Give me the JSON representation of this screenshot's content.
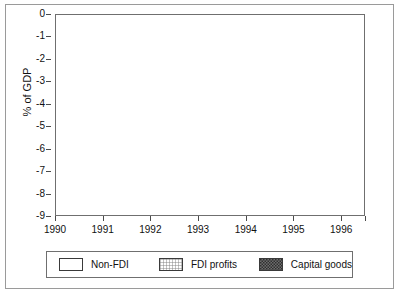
{
  "chart_data": {
    "type": "area",
    "title": "",
    "subtitle": "",
    "xlabel": "",
    "ylabel": "% of GDP",
    "ylim": [
      -9,
      0
    ],
    "xlim": [
      1990,
      1996.5
    ],
    "grid": true,
    "stacked": true,
    "legend_position": "bottom",
    "x": [
      1990,
      1991,
      1992,
      1993,
      1994,
      1995,
      1996,
      1996.5
    ],
    "xtick_labels": [
      "1990",
      "1991",
      "1992",
      "1993",
      "1994",
      "1995",
      "1996",
      ""
    ],
    "ytick_labels": [
      "0",
      "-1",
      "-2",
      "-3",
      "-4",
      "-5",
      "-6",
      "-7",
      "-8",
      "-9"
    ],
    "ytick_values": [
      0,
      -1,
      -2,
      -3,
      -4,
      -5,
      -6,
      -7,
      -8,
      -9
    ],
    "series": [
      {
        "name": "Non-FDI",
        "pattern": "none",
        "values": [
          -7.05,
          -6.95,
          -4.45,
          -4.05,
          -4.75,
          -7.15,
          -7.0,
          -5.9
        ]
      },
      {
        "name": "FDI profits",
        "pattern": "fine-cross-hatch",
        "values": [
          -1.55,
          -1.1,
          -1.0,
          -0.7,
          -0.45,
          -0.65,
          -0.7,
          -0.8
        ]
      },
      {
        "name": "Capital goods",
        "pattern": "dark-checker",
        "values": [
          -0.25,
          -0.1,
          -0.15,
          -0.1,
          -0.1,
          -0.25,
          -0.2,
          -0.3
        ]
      }
    ],
    "cumulative_boundaries": {
      "non_fdi_top": [
        -7.05,
        -6.95,
        -4.45,
        -4.05,
        -4.75,
        -7.15,
        -7.0,
        -5.9
      ],
      "fdi_profits_bottom": [
        -8.6,
        -8.05,
        -5.45,
        -4.75,
        -5.2,
        -7.8,
        -7.7,
        -6.7
      ],
      "capital_goods_bottom": [
        -8.85,
        -8.15,
        -5.6,
        -4.85,
        -5.3,
        -8.05,
        -7.9,
        -7.0
      ]
    }
  },
  "legend": {
    "items": [
      {
        "label": "Non-FDI",
        "swatch": "non-fdi-swatch"
      },
      {
        "label": "FDI profits",
        "swatch": "fdi-profits-swatch"
      },
      {
        "label": "Capital goods",
        "swatch": "capital-goods-swatch"
      }
    ]
  },
  "colors": {
    "frame": "#6f6f6f",
    "outer_frame": "#9a9a9a",
    "gridline": "#c8c8c8",
    "axis_text": "#111111",
    "band_outline": "#3a3a3a",
    "background": "#ffffff"
  }
}
